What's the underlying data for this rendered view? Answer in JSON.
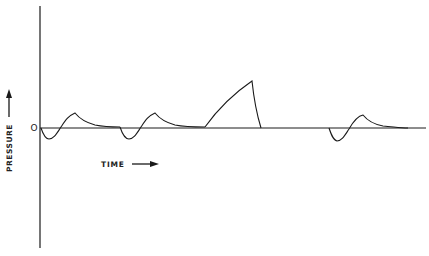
{
  "diagram": {
    "type": "pressure-time waveform",
    "y_axis_label": "PRESSURE",
    "x_axis_label": "TIME",
    "zero_label": "O",
    "line_color": "#1a1a1a",
    "background": "#ffffff",
    "waveforms": [
      {
        "name": "normal-wave-1",
        "description": "brief negative dip followed by small positive peak decaying to baseline"
      },
      {
        "name": "normal-wave-2",
        "description": "brief negative dip followed by small positive peak decaying to baseline"
      },
      {
        "name": "large-spike",
        "description": "large positive ramp rising to peak then sharp drop back to baseline"
      },
      {
        "name": "normal-wave-3",
        "description": "brief negative dip followed by small positive peak decaying to baseline"
      }
    ]
  }
}
